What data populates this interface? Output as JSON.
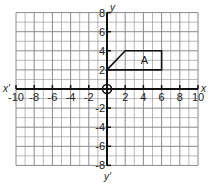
{
  "diagram": {
    "type": "coordinate-grid",
    "x_range": [
      -10,
      10
    ],
    "y_range": [
      -8,
      8
    ],
    "grid_step": 1,
    "tick_step": 2,
    "axis_labels": {
      "x_positive": "x",
      "x_negative": "x'",
      "y_positive": "y",
      "y_negative": "y'"
    },
    "x_tick_labels": [
      "-10",
      "-8",
      "-6",
      "-4",
      "-2",
      "2",
      "4",
      "6",
      "8",
      "10"
    ],
    "y_tick_labels": [
      "8",
      "6",
      "4",
      "2",
      "-2",
      "-4",
      "-6",
      "-8"
    ],
    "origin_marker": "circle",
    "shapes": [
      {
        "label": "A",
        "vertices": [
          [
            0,
            2
          ],
          [
            2,
            4
          ],
          [
            6,
            4
          ],
          [
            6,
            2
          ]
        ]
      }
    ],
    "colors": {
      "grid": "#8a8a8a",
      "axis": "#111111",
      "shape": "#111111",
      "background": "#ffffff"
    }
  }
}
